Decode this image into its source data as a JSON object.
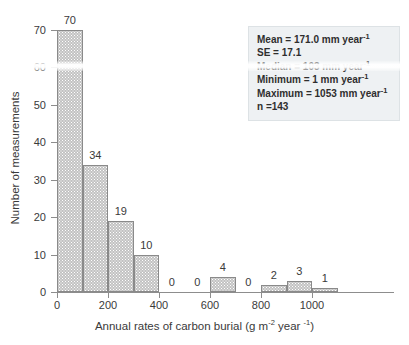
{
  "chart_data": {
    "type": "bar",
    "title": "",
    "xlabel_parts": {
      "main": "Annual rates of carbon burial (g m",
      "sup1": "-2",
      "mid": " year ",
      "sup2": "-1",
      "end": ")"
    },
    "xlabel": "Annual rates of carbon burial (g m-2 year -1)",
    "ylabel": "Number of measurements",
    "categories": [
      "0-100",
      "100-200",
      "200-300",
      "300-400",
      "400-500",
      "500-600",
      "600-700",
      "700-800",
      "800-900",
      "900-1000",
      "1000-1100"
    ],
    "bin_starts": [
      0,
      100,
      200,
      300,
      400,
      500,
      600,
      700,
      800,
      900,
      1000
    ],
    "bin_width": 100,
    "values": [
      70,
      34,
      19,
      10,
      0,
      0,
      4,
      0,
      2,
      3,
      1
    ],
    "value_labels": [
      "70",
      "34",
      "19",
      "10",
      "0",
      "0",
      "4",
      "0",
      "2",
      "3",
      "1"
    ],
    "xlim": [
      0,
      1100
    ],
    "ylim": [
      0,
      70
    ],
    "xticks": [
      0,
      200,
      400,
      600,
      800,
      1000
    ],
    "xtick_labels": [
      "0",
      "200",
      "400",
      "600",
      "800",
      "1000"
    ],
    "yticks": [
      0,
      10,
      20,
      30,
      40,
      50,
      60,
      70
    ],
    "ytick_labels": [
      "0",
      "10",
      "20",
      "30",
      "40",
      "50",
      "60",
      "70"
    ],
    "grid": false,
    "legend": false,
    "bar_fill_color": "#c2c2c2",
    "bar_border_color": "#8a8a8a",
    "axis_color": "#8d8d8d",
    "text_color": "#3a3a3a"
  },
  "stats_box": {
    "background_color": "#eef1f3",
    "lines": [
      {
        "id": "mean",
        "text": "Mean = 171.0 mm year",
        "sup": "-1"
      },
      {
        "id": "se",
        "text": "SE = 17.1",
        "sup": ""
      },
      {
        "id": "median",
        "text": "Median = 103 mm year",
        "sup": "-1"
      },
      {
        "id": "minimum",
        "text": "Minimum = 1 mm year",
        "sup": "-1"
      },
      {
        "id": "maximum",
        "text": "Maximum = 1053 mm year",
        "sup": "-1"
      },
      {
        "id": "n",
        "text": "n =143",
        "sup": ""
      }
    ]
  }
}
